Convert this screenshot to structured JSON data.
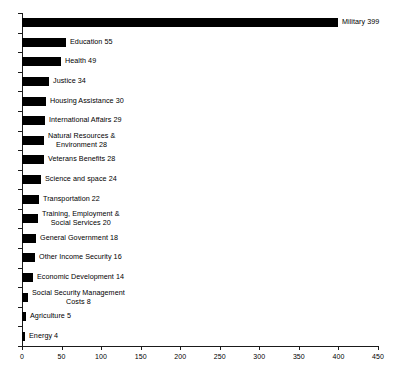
{
  "chart_data": {
    "type": "bar",
    "orientation": "horizontal",
    "title": "",
    "subtitle": "",
    "xlabel": "",
    "ylabel": "",
    "xlim": [
      0,
      450
    ],
    "grid": false,
    "legend": false,
    "x_ticks": [
      0,
      50,
      100,
      150,
      200,
      250,
      300,
      350,
      400,
      450
    ],
    "x_tick_labels": [
      "0",
      "50",
      "100",
      "150",
      "200",
      "250",
      "300",
      "350",
      "400",
      "450"
    ],
    "categories": [
      "Military",
      "Education",
      "Health",
      "Justice",
      "Housing Assistance",
      "International Affairs",
      "Natural Resources & Environment",
      "Veterans Benefits",
      "Science and space",
      "Transportation",
      "Training, Employment & Social Services",
      "General Government",
      "Other Income Security",
      "Economic Development",
      "Social Security Management Costs",
      "Agriculture",
      "Energy"
    ],
    "values": [
      399,
      55,
      49,
      34,
      30,
      29,
      28,
      28,
      24,
      22,
      20,
      18,
      16,
      14,
      8,
      5,
      4
    ],
    "bar_color": "#000000",
    "axis_color": "#1a1a1a",
    "data_labels": [
      {
        "text": "Military 399",
        "lines": [
          "Military 399"
        ],
        "align": "left"
      },
      {
        "text": "Education 55",
        "lines": [
          "Education 55"
        ],
        "align": "left"
      },
      {
        "text": "Health 49",
        "lines": [
          "Health 49"
        ],
        "align": "left"
      },
      {
        "text": "Justice 34",
        "lines": [
          "Justice 34"
        ],
        "align": "left"
      },
      {
        "text": "Housing Assistance 30",
        "lines": [
          "Housing Assistance 30"
        ],
        "align": "left"
      },
      {
        "text": "International Affairs 29",
        "lines": [
          "International Affairs 29"
        ],
        "align": "left"
      },
      {
        "text": "Natural Resources & Environment 28",
        "lines": [
          "Natural Resources &",
          "Environment 28"
        ],
        "align": "center"
      },
      {
        "text": "Veterans Benefits 28",
        "lines": [
          "Veterans Benefits 28"
        ],
        "align": "left"
      },
      {
        "text": "Science and space 24",
        "lines": [
          "Science and space 24"
        ],
        "align": "left"
      },
      {
        "text": "Transportation 22",
        "lines": [
          "Transportation 22"
        ],
        "align": "left"
      },
      {
        "text": "Training, Employment & Social Services 20",
        "lines": [
          "Training, Employment &",
          "Social Services 20"
        ],
        "align": "center"
      },
      {
        "text": "General Government 18",
        "lines": [
          "General Government 18"
        ],
        "align": "left"
      },
      {
        "text": "Other Income Security 16",
        "lines": [
          "Other Income Security 16"
        ],
        "align": "left"
      },
      {
        "text": "Economic Development 14",
        "lines": [
          "Economic Development 14"
        ],
        "align": "left"
      },
      {
        "text": "Social Security Management Costs 8",
        "lines": [
          "Social Security Management",
          "Costs 8"
        ],
        "align": "center"
      },
      {
        "text": "Agriculture 5",
        "lines": [
          "Agriculture 5"
        ],
        "align": "left"
      },
      {
        "text": "Energy 4",
        "lines": [
          "Energy 4"
        ],
        "align": "left"
      }
    ]
  }
}
